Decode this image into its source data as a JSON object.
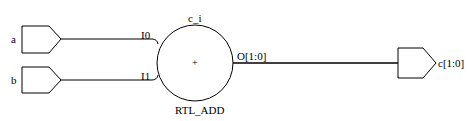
{
  "schematic": {
    "cell": {
      "instance_name": "c_i",
      "type": "RTL_ADD",
      "symbol": "+",
      "pins_in": [
        "I0",
        "I1"
      ],
      "pin_out": "O[1:0]"
    },
    "inputs": [
      {
        "name": "a",
        "pin": "I0"
      },
      {
        "name": "b",
        "pin": "I1"
      }
    ],
    "output": {
      "name": "c[1:0]",
      "pin": "O[1:0]"
    },
    "colors": {
      "line": "#000000",
      "background": "#ffffff"
    }
  }
}
